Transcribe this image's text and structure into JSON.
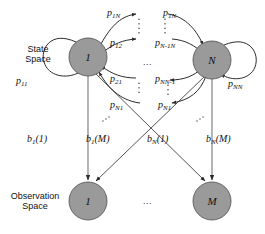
{
  "figure": {
    "background_color": "#ffffff",
    "node_fill_color": "#9a9a9a",
    "node_stroke_color": "#4d4d4d",
    "edge_color": "#2b2b2b"
  },
  "sections": {
    "state_space_label_line1": "State",
    "state_space_label_line2": "Space",
    "observation_space_label_line1": "Observation",
    "observation_space_label_line2": "Space"
  },
  "state_nodes": [
    {
      "id": "state-1",
      "label": "1",
      "cx": 88,
      "cy": 57,
      "r": 19
    },
    {
      "id": "state-N",
      "label": "N",
      "cx": 212,
      "cy": 60,
      "r": 19
    }
  ],
  "observation_nodes": [
    {
      "id": "obs-1",
      "label": "1",
      "cx": 88,
      "cy": 201,
      "r": 19
    },
    {
      "id": "obs-M",
      "label": "M",
      "cx": 212,
      "cy": 201,
      "r": 19
    }
  ],
  "ellipses": {
    "state_space_between": "...",
    "observation_space_between": "..."
  },
  "transition_labels": [
    {
      "id": "p-1N-left",
      "base": "p",
      "sub": "1N",
      "x": 107,
      "y": 8
    },
    {
      "id": "p-1N-right",
      "base": "p",
      "sub": "1N",
      "x": 163,
      "y": 8
    },
    {
      "id": "p-12",
      "base": "p",
      "sub": "12",
      "x": 110,
      "y": 38
    },
    {
      "id": "p-N-1N",
      "base": "p",
      "sub": "N-1N",
      "x": 155,
      "y": 38
    },
    {
      "id": "p-21",
      "base": "p",
      "sub": "21",
      "x": 110,
      "y": 74
    },
    {
      "id": "p-NN-1",
      "base": "p",
      "sub": "NN-1",
      "x": 155,
      "y": 74
    },
    {
      "id": "p-N1-left",
      "base": "p",
      "sub": "N1",
      "x": 110,
      "y": 100
    },
    {
      "id": "p-N1-right",
      "base": "p",
      "sub": "N1",
      "x": 158,
      "y": 100
    },
    {
      "id": "p-11",
      "base": "p",
      "sub": "11",
      "x": 16,
      "y": 76
    },
    {
      "id": "p-NN",
      "base": "p",
      "sub": "NN",
      "x": 228,
      "y": 79
    }
  ],
  "emission_labels": [
    {
      "id": "b-1-1",
      "base": "b",
      "sub": "1",
      "arg": "(1)",
      "x": 27,
      "y": 134
    },
    {
      "id": "b-1-M",
      "base": "b",
      "sub": "1",
      "arg": "(M)",
      "x": 86,
      "y": 134
    },
    {
      "id": "b-N-1",
      "base": "b",
      "sub": "N",
      "arg": "(1)",
      "x": 147,
      "y": 134
    },
    {
      "id": "b-N-M",
      "base": "b",
      "sub": "N",
      "arg": "(M)",
      "x": 206,
      "y": 134
    }
  ]
}
